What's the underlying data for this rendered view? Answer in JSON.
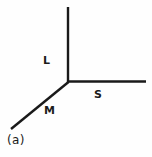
{
  "figure": {
    "caption": "(a)",
    "background_color": "#fefefe",
    "stroke_color": "#1a1a1a",
    "stroke_width": 2.4,
    "junction": {
      "x": 68,
      "y": 82
    },
    "branches": [
      {
        "id": "long",
        "label": "L",
        "direction": "up",
        "from": {
          "x": 68,
          "y": 82
        },
        "to": {
          "x": 68,
          "y": 7
        },
        "label_position": {
          "x": 43,
          "y": 55
        }
      },
      {
        "id": "short",
        "label": "S",
        "direction": "right",
        "from": {
          "x": 68,
          "y": 82
        },
        "to": {
          "x": 146,
          "y": 81
        },
        "label_position": {
          "x": 94,
          "y": 89
        }
      },
      {
        "id": "medium",
        "label": "M",
        "direction": "down-left",
        "from": {
          "x": 68,
          "y": 82
        },
        "to": {
          "x": 11,
          "y": 129
        },
        "label_position": {
          "x": 44,
          "y": 105
        }
      }
    ]
  }
}
